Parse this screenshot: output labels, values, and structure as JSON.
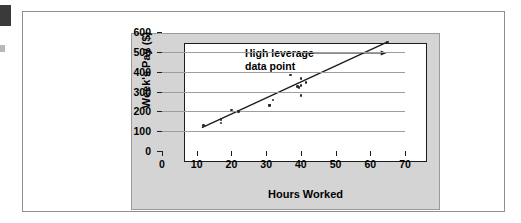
{
  "figure": {
    "panel_background": "#d4d4d4",
    "plot_background": "#ffffff",
    "frame_color": "#1c1c1c",
    "grid_color": "#9d9d9d",
    "point_color": "#2a2a2a",
    "annotation_line1": "High leverage",
    "annotation_line2": "data point"
  },
  "chart_data": {
    "type": "scatter",
    "title": "",
    "xlabel": "Hours Worked",
    "ylabel": "Week's Pay ($)",
    "xlim": [
      0,
      70
    ],
    "ylim": [
      0,
      600
    ],
    "xticks": [
      0,
      10,
      20,
      30,
      40,
      50,
      60,
      70
    ],
    "yticks": [
      0,
      100,
      200,
      300,
      400,
      500,
      600
    ],
    "grid": "horizontal",
    "legend": "none",
    "annotations": [
      {
        "text": "High leverage data point",
        "points_to": [
          65,
          550
        ],
        "arrow": true
      }
    ],
    "points": [
      {
        "x": 12,
        "y": 130
      },
      {
        "x": 17,
        "y": 160
      },
      {
        "x": 17,
        "y": 142
      },
      {
        "x": 20,
        "y": 207
      },
      {
        "x": 22,
        "y": 200
      },
      {
        "x": 31,
        "y": 232
      },
      {
        "x": 31,
        "y": 228
      },
      {
        "x": 32,
        "y": 258
      },
      {
        "x": 37,
        "y": 383
      },
      {
        "x": 39,
        "y": 325
      },
      {
        "x": 39.5,
        "y": 320
      },
      {
        "x": 40,
        "y": 365
      },
      {
        "x": 40,
        "y": 330
      },
      {
        "x": 40,
        "y": 280
      },
      {
        "x": 41.5,
        "y": 345
      },
      {
        "x": 65,
        "y": 550
      }
    ],
    "trendline": {
      "type": "linear",
      "x_start": 11.5,
      "y_start": 118,
      "x_end": 65,
      "y_end": 550
    }
  }
}
